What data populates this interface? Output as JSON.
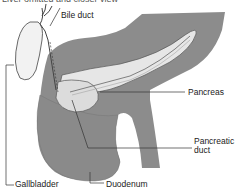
{
  "diagram": {
    "caption_clipped": "Liver omitted and closer view",
    "labels": {
      "bile_duct": "Bile duct",
      "pancreas": "Pancreas",
      "pancreatic_duct_line1": "Pancreatic",
      "pancreatic_duct_line2": "duct",
      "gallbladder": "Gallbladder",
      "duodenum": "Duodenum"
    },
    "colors": {
      "organ_fill": "#8c8c8c",
      "pancreas_fill": "#e8e8e8",
      "leader_line": "#333333"
    }
  }
}
